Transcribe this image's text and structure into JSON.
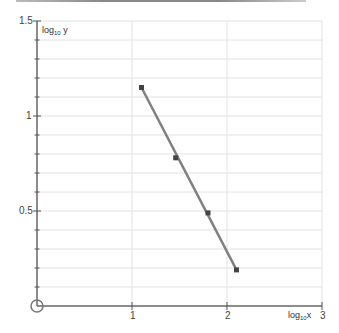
{
  "chart_data": {
    "type": "line",
    "title": "",
    "xlabel": "log10x",
    "ylabel": "log10 y",
    "xlim": [
      0,
      3
    ],
    "ylim": [
      0,
      1.5
    ],
    "x_ticks": [
      "1",
      "2",
      "3"
    ],
    "y_ticks": [
      "0.5",
      "1",
      "1.5"
    ],
    "grid": true,
    "series": [
      {
        "name": "data",
        "x": [
          1.1,
          1.46,
          1.8,
          2.1
        ],
        "y": [
          1.15,
          0.78,
          0.49,
          0.19
        ],
        "marker": "square",
        "color": "#7a7a7a"
      }
    ],
    "fit_line": {
      "x": [
        1.1,
        2.1
      ],
      "y": [
        1.15,
        0.19
      ],
      "color": "#808080"
    }
  },
  "labels": {
    "x_axis_title_main": "log",
    "x_axis_title_sub": "10",
    "x_axis_title_var": "x",
    "y_axis_title_main": "log",
    "y_axis_title_sub": "10",
    "y_axis_title_var": " y",
    "x_tick_1": "1",
    "x_tick_2": "2",
    "x_tick_3": "3",
    "y_tick_05": "0.5",
    "y_tick_1": "1",
    "y_tick_15": "1.5"
  }
}
